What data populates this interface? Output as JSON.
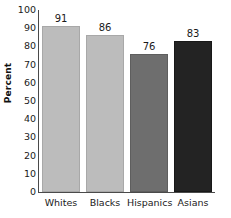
{
  "chart_data": {
    "type": "bar",
    "title": "",
    "xlabel": "",
    "ylabel": "Percent",
    "categories": [
      "Whites",
      "Blacks",
      "Hispanics",
      "Asians"
    ],
    "values": [
      91,
      86,
      76,
      83
    ],
    "value_labels": [
      "91",
      "86",
      "76",
      "83"
    ],
    "ylim": [
      0,
      100
    ],
    "ytick_labels": [
      "100",
      "90",
      "80",
      "70",
      "60",
      "50",
      "40",
      "30",
      "20",
      "10",
      "0"
    ],
    "ytick_values": [
      100,
      90,
      80,
      70,
      60,
      50,
      40,
      30,
      20,
      10,
      0
    ],
    "grid": false,
    "legend": false,
    "legend_position": "none",
    "bar_colors": [
      "#bcbcbc",
      "#bcbcbc",
      "#6e6e6e",
      "#232323"
    ],
    "bar_border_colors": [
      "#a8a8a8",
      "#a8a8a8",
      "#5e5e5e",
      "#181818"
    ],
    "axis_color": "#4a4a4a",
    "background_color": "#ffffff",
    "text_color": "#1a1a1a"
  }
}
